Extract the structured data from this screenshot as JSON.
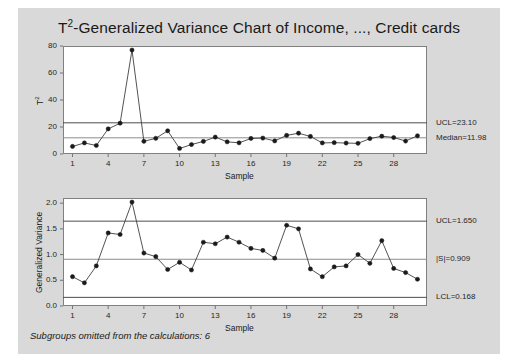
{
  "title": {
    "prefix": "T",
    "sup": "2",
    "rest": "-Generalized Variance Chart of Income, ..., Credit cards"
  },
  "footnote": "Subgroups omitted from the calculations: 6",
  "charts": [
    {
      "id": "t2-chart",
      "ylabel_prefix": "T",
      "ylabel_sup": "2",
      "xlabel": "Sample",
      "yticks": [
        "0",
        "20",
        "40",
        "60",
        "80"
      ],
      "ytick_values": [
        0,
        20,
        40,
        60,
        80
      ],
      "xticks": [
        "1",
        "4",
        "7",
        "10",
        "13",
        "16",
        "19",
        "22",
        "25",
        "28"
      ],
      "xtick_values": [
        1,
        4,
        7,
        10,
        13,
        16,
        19,
        22,
        25,
        28
      ],
      "limits": [
        {
          "name": "ucl",
          "label": "UCL=23.10",
          "value": 23.1
        },
        {
          "name": "median",
          "label": "Median=11.98",
          "value": 11.98
        }
      ]
    },
    {
      "id": "gv-chart",
      "ylabel_prefix": "Generalized Variance",
      "ylabel_sup": "",
      "xlabel": "Sample",
      "yticks": [
        "0.0",
        "0.5",
        "1.0",
        "1.5",
        "2.0"
      ],
      "ytick_values": [
        0.0,
        0.5,
        1.0,
        1.5,
        2.0
      ],
      "xticks": [
        "1",
        "4",
        "7",
        "10",
        "13",
        "16",
        "19",
        "22",
        "25",
        "28"
      ],
      "xtick_values": [
        1,
        4,
        7,
        10,
        13,
        16,
        19,
        22,
        25,
        28
      ],
      "limits": [
        {
          "name": "ucl",
          "label": "UCL=1.650",
          "value": 1.65
        },
        {
          "name": "center",
          "label": "|S|=0.909",
          "value": 0.909
        },
        {
          "name": "lcl",
          "label": "LCL=0.168",
          "value": 0.168
        }
      ]
    }
  ],
  "chart_data": [
    {
      "type": "line",
      "name": "t2-chart",
      "title": "T²-Generalized Variance Chart of Income, ..., Credit cards",
      "xlabel": "Sample",
      "ylabel": "T²",
      "xlim": [
        0.2,
        30.8
      ],
      "ylim": [
        0,
        80
      ],
      "grid": false,
      "legend": "none",
      "x": [
        1,
        2,
        3,
        4,
        5,
        6,
        7,
        8,
        9,
        10,
        11,
        12,
        13,
        14,
        15,
        16,
        17,
        18,
        19,
        20,
        21,
        22,
        23,
        24,
        25,
        26,
        27,
        28,
        29,
        30
      ],
      "values": [
        5.6,
        8.2,
        6.3,
        18.6,
        22.8,
        77.0,
        9.4,
        11.6,
        17.2,
        4.1,
        7.0,
        9.3,
        12.5,
        9.0,
        8.3,
        11.5,
        11.8,
        9.7,
        13.8,
        15.4,
        13.0,
        8.2,
        8.4,
        8.1,
        7.9,
        11.4,
        13.2,
        12.2,
        9.6,
        13.5
      ],
      "control_limits": {
        "UCL": 23.1,
        "Median": 11.98
      },
      "annotations": [
        "UCL=23.10",
        "Median=11.98"
      ]
    },
    {
      "type": "line",
      "name": "gv-chart",
      "xlabel": "Sample",
      "ylabel": "Generalized Variance",
      "xlim": [
        0.2,
        30.8
      ],
      "ylim": [
        0.0,
        2.1
      ],
      "grid": false,
      "legend": "none",
      "x": [
        1,
        2,
        3,
        4,
        5,
        6,
        7,
        8,
        9,
        10,
        11,
        12,
        13,
        14,
        15,
        16,
        17,
        18,
        19,
        20,
        21,
        22,
        23,
        24,
        25,
        26,
        27,
        28,
        29,
        30
      ],
      "values": [
        0.57,
        0.45,
        0.78,
        1.42,
        1.39,
        2.02,
        1.03,
        0.96,
        0.71,
        0.85,
        0.7,
        1.24,
        1.21,
        1.34,
        1.24,
        1.12,
        1.08,
        0.93,
        1.57,
        1.5,
        0.72,
        0.57,
        0.76,
        0.78,
        1.0,
        0.83,
        1.27,
        0.73,
        0.65,
        0.52
      ],
      "control_limits": {
        "UCL": 1.65,
        "CenterLine": 0.909,
        "LCL": 0.168
      },
      "annotations": [
        "UCL=1.650",
        "|S|=0.909",
        "LCL=0.168"
      ]
    }
  ]
}
